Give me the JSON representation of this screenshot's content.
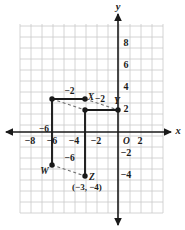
{
  "figure": {
    "type": "coordinate-graph",
    "background_color": "#ffffff",
    "grid_color": "#c9c9c9",
    "axis_color": "#1a1a1a",
    "shape_color": "#1a1a1a",
    "dash_color": "#6e6e6e"
  },
  "axes": {
    "x_axis_name": "x",
    "y_axis_name": "y",
    "origin_label": "O",
    "x_ticks": [
      "-8",
      "-6",
      "-4",
      "-2",
      "2"
    ],
    "y_ticks": [
      "8",
      "6",
      "4",
      "2",
      "-2",
      "-4"
    ],
    "x_range": [
      -9,
      3
    ],
    "y_range": [
      -5,
      9
    ],
    "grid": true,
    "unit_px": 11
  },
  "points": [
    {
      "name": "X",
      "label": "X",
      "x": -3,
      "y": 3
    },
    {
      "name": "Y",
      "label": "Y",
      "x": 0,
      "y": 2
    },
    {
      "name": "W",
      "label": "W",
      "x": -6,
      "y": -3
    },
    {
      "name": "Z",
      "label": "Z",
      "x": -3,
      "y": -4
    }
  ],
  "annotations": {
    "z_coordinate": "(−3, −4)",
    "segment_labels": [
      {
        "text": "−2",
        "note": "top segment of original figure"
      },
      {
        "text": "−2",
        "note": "right of X"
      },
      {
        "text": "−6",
        "note": "left vertical segment"
      },
      {
        "text": "−6",
        "note": "lower middle"
      }
    ]
  },
  "original_figure": {
    "vertices": [
      [
        -6,
        3
      ],
      [
        -3,
        3
      ],
      [
        -6,
        3
      ],
      [
        -6,
        -3
      ]
    ],
    "style": "solid"
  },
  "image_figure": {
    "vertices": [
      [
        -3,
        2
      ],
      [
        0,
        2
      ],
      [
        -3,
        2
      ],
      [
        -3,
        -4
      ]
    ],
    "style": "solid"
  },
  "chart_data": {
    "type": "scatter",
    "title": "",
    "xlabel": "x",
    "ylabel": "y",
    "xlim": [
      -9,
      3
    ],
    "ylim": [
      -5,
      9
    ],
    "grid": true,
    "series": [
      {
        "name": "preimage",
        "points": [
          {
            "label": "",
            "x": -6,
            "y": 3
          },
          {
            "label": "X",
            "x": -3,
            "y": 3
          },
          {
            "label": "W",
            "x": -6,
            "y": -3
          }
        ]
      },
      {
        "name": "image",
        "points": [
          {
            "label": "",
            "x": -3,
            "y": 2
          },
          {
            "label": "Y",
            "x": 0,
            "y": 2
          },
          {
            "label": "Z",
            "x": -3,
            "y": -4
          }
        ]
      }
    ]
  }
}
